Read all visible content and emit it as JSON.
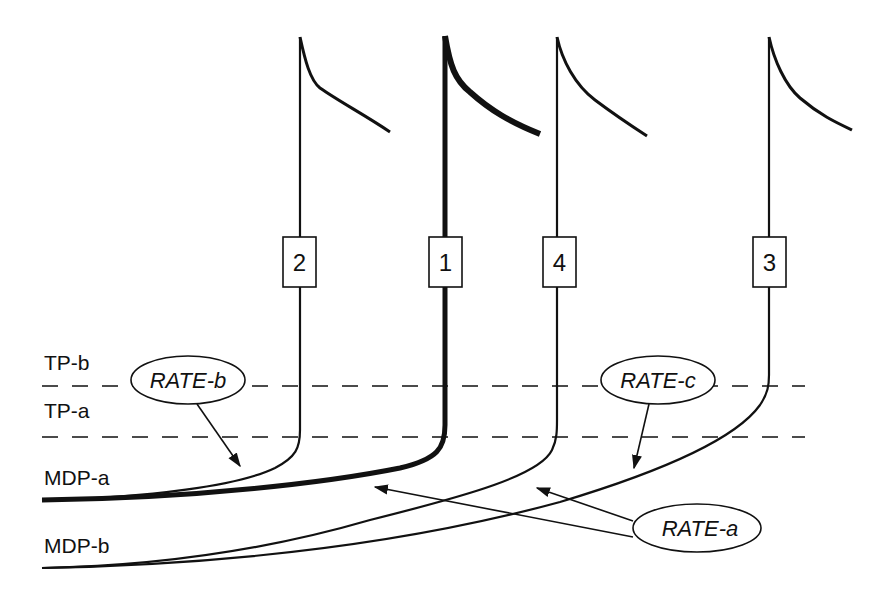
{
  "diagram": {
    "level_labels": {
      "tp_b": "TP-b",
      "tp_a": "TP-a",
      "mdp_a": "MDP-a",
      "mdp_b": "MDP-b"
    },
    "rate_labels": {
      "rate_a": "RATE-a",
      "rate_b": "RATE-b",
      "rate_c": "RATE-c"
    },
    "traces": [
      {
        "id": "trace-2",
        "label": "2",
        "order_left_to_right": 1,
        "baseline": "MDP-a",
        "stroke": "thin"
      },
      {
        "id": "trace-1",
        "label": "1",
        "order_left_to_right": 2,
        "baseline": "MDP-a",
        "stroke": "thick"
      },
      {
        "id": "trace-4",
        "label": "4",
        "order_left_to_right": 3,
        "baseline": "MDP-b",
        "stroke": "thin"
      },
      {
        "id": "trace-3",
        "label": "3",
        "order_left_to_right": 4,
        "baseline": "MDP-b",
        "stroke": "thin"
      }
    ],
    "colors": {
      "line": "#111111",
      "background": "#ffffff"
    }
  }
}
